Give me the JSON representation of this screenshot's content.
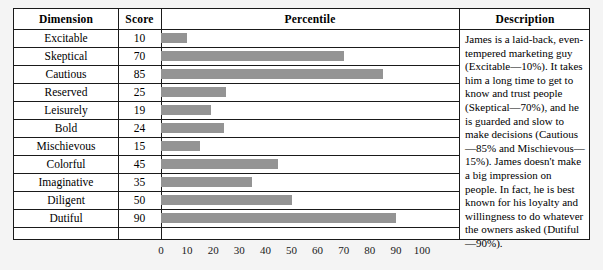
{
  "table": {
    "headers": {
      "dimension": "Dimension",
      "score": "Score",
      "percentile": "Percentile",
      "description": "Description"
    },
    "rows": [
      {
        "dimension": "Excitable",
        "score": 10
      },
      {
        "dimension": "Skeptical",
        "score": 70
      },
      {
        "dimension": "Cautious",
        "score": 85
      },
      {
        "dimension": "Reserved",
        "score": 25
      },
      {
        "dimension": "Leisurely",
        "score": 19
      },
      {
        "dimension": "Bold",
        "score": 24
      },
      {
        "dimension": "Mischievous",
        "score": 15
      },
      {
        "dimension": "Colorful",
        "score": 45
      },
      {
        "dimension": "Imaginative",
        "score": 35
      },
      {
        "dimension": "Diligent",
        "score": 50
      },
      {
        "dimension": "Dutiful",
        "score": 90
      }
    ],
    "description": "James is a laid-back, even-tempered marketing guy (Excitable—10%). It takes him a long time to get to know and trust people (Skeptical—70%), and he is guarded and slow to make decisions (Cautious—85% and Mischievous—15%). James doesn't make a big impression on people. In fact, he is best known for his loyalty and willingness to do whatever the owners asked (Dutiful—90%)."
  },
  "axis": {
    "ticks": [
      "0",
      "10",
      "20",
      "30",
      "40",
      "50",
      "60",
      "70",
      "80",
      "90",
      "100"
    ]
  },
  "chart_data": {
    "type": "bar",
    "title": "Percentile",
    "xlabel": "",
    "ylabel": "Dimension",
    "orientation": "horizontal",
    "categories": [
      "Excitable",
      "Skeptical",
      "Cautious",
      "Reserved",
      "Leisurely",
      "Bold",
      "Mischievous",
      "Colorful",
      "Imaginative",
      "Diligent",
      "Dutiful"
    ],
    "values": [
      10,
      70,
      85,
      25,
      19,
      24,
      15,
      45,
      35,
      50,
      90
    ],
    "xlim": [
      0,
      100
    ],
    "xticks": [
      0,
      10,
      20,
      30,
      40,
      50,
      60,
      70,
      80,
      90,
      100
    ],
    "grid": false,
    "legend": null,
    "bar_color": "#949494"
  },
  "style": {
    "bar_color": "#949494",
    "border_color": "#1a1a1a",
    "page_background": "#f4f4f4",
    "cell_background": "#ffffff"
  }
}
